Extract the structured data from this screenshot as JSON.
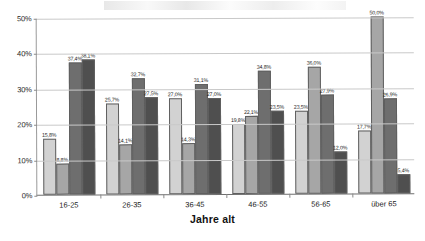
{
  "chart_data": {
    "type": "bar",
    "title": "",
    "subtitle": "",
    "xlabel": "Jahre alt",
    "ylabel": "",
    "categories": [
      "16-25",
      "26-35",
      "36-45",
      "46-55",
      "56-65",
      "über 65"
    ],
    "ylim": [
      0,
      50
    ],
    "ytick_labels": [
      "0%",
      "10%",
      "20%",
      "30%",
      "40%",
      "50%"
    ],
    "ytick_values": [
      0,
      10,
      20,
      30,
      40,
      50
    ],
    "grid": true,
    "grid_axis": "y",
    "legend": false,
    "legend_position": "none",
    "value_labels": true,
    "value_label_suffix": "%",
    "series": [
      {
        "name": "Serie 1",
        "color": "#d2d2d2",
        "values": [
          15.8,
          25.7,
          27.0,
          19.8,
          23.5,
          17.7
        ],
        "labels": [
          "15,8%",
          "25,7%",
          "27,0%",
          "19,8%",
          "23,5%",
          "17,7%"
        ]
      },
      {
        "name": "Serie 2",
        "color": "#a6a6a6",
        "values": [
          8.8,
          14.1,
          14.3,
          22.1,
          36.0,
          50.0
        ],
        "labels": [
          "8,8%",
          "14,1%",
          "14,3%",
          "22,1%",
          "36,0%",
          "50,0%"
        ]
      },
      {
        "name": "Serie 3",
        "color": "#6e6e6e",
        "values": [
          37.4,
          32.7,
          31.1,
          34.8,
          27.9,
          26.9
        ],
        "labels": [
          "37,4%",
          "32,7%",
          "31,1%",
          "34,8%",
          "27,9%",
          "26,9%"
        ]
      },
      {
        "name": "Serie 4",
        "color": "#4f4f4f",
        "values": [
          38.1,
          27.5,
          27.0,
          23.5,
          12.0,
          5.4
        ],
        "labels": [
          "38,1%",
          "27,5%",
          "27,0%",
          "23,5%",
          "12,0%",
          "5,4%"
        ]
      }
    ]
  }
}
